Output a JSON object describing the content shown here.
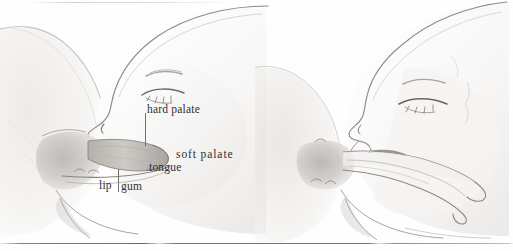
{
  "figure": {
    "kind": "anatomical-pencil-sketch",
    "panel_count": 2,
    "panels": [
      {
        "id": "panel-left",
        "name": "deep-latch-cross-section",
        "description": "Profile of an infant's head latched at the breast, showing the nipple drawn deep into the mouth against the palate."
      },
      {
        "id": "panel-right",
        "name": "released-nipple-cross-section",
        "description": "Profile of an infant's head at the breast with the elongated nipple and milk ducts drawn outward."
      }
    ]
  },
  "labels": [
    {
      "id": "hard-palate",
      "text": "hard palate"
    },
    {
      "id": "soft-palate",
      "text": "soft palate"
    },
    {
      "id": "tongue",
      "text": "tongue"
    },
    {
      "id": "lip",
      "text": "lip"
    },
    {
      "id": "gum",
      "text": "gum"
    }
  ],
  "style": {
    "ink": "#2e2e2e",
    "leader_line": "#6f6f6f",
    "paper": "#fefefe",
    "rule": "#555555",
    "graphite_light": "#e3e1df",
    "graphite_mid": "#c9c6c3",
    "graphite_dark": "#9a9692"
  }
}
